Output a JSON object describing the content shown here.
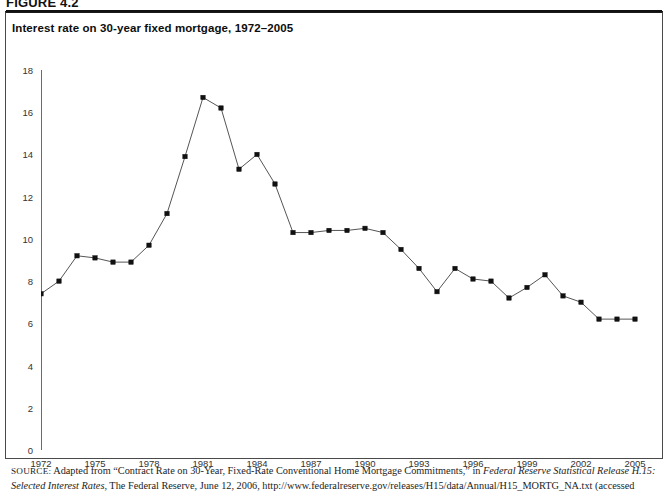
{
  "figure": {
    "label": "FIGURE 4.2",
    "title": "Interest rate on 30-year fixed mortgage, 1972–2005"
  },
  "source": {
    "prefix": "SOURCE:",
    "line1_a": " Adapted from “Contract Rate on 30-Year, Fixed-Rate Conventional Home Mortgage Commitments,” in ",
    "line1_italic": "Federal Reserve Statistical Release H.15:",
    "line2_italic": "Selected Interest Rates",
    "line2_b": ", The Federal Reserve, June 12, 2006, http://www.federalreserve.gov/releases/H15/data/Annual/H15_MORTG_NA.txt (accessed"
  },
  "chart_data": {
    "type": "line",
    "title": "Interest rate on 30-year fixed mortgage, 1972–2005",
    "xlabel": "",
    "ylabel": "",
    "xlim": [
      1972,
      2005
    ],
    "ylim": [
      0,
      18
    ],
    "ytick_step": 2,
    "xtick_step": 3,
    "grid": false,
    "legend_position": "none",
    "marker": "square",
    "marker_color": "#111111",
    "line_color": "#555555",
    "yticks": [
      0,
      2,
      4,
      6,
      8,
      10,
      12,
      14,
      16,
      18
    ],
    "xticks": [
      1972,
      1975,
      1978,
      1981,
      1984,
      1987,
      1990,
      1993,
      1996,
      1999,
      2002,
      2005
    ],
    "x": [
      1972,
      1973,
      1974,
      1975,
      1976,
      1977,
      1978,
      1979,
      1980,
      1981,
      1982,
      1983,
      1984,
      1985,
      1986,
      1987,
      1988,
      1989,
      1990,
      1991,
      1992,
      1993,
      1994,
      1995,
      1996,
      1997,
      1998,
      1999,
      2000,
      2001,
      2002,
      2003,
      2004,
      2005
    ],
    "values": [
      7.4,
      8.0,
      9.2,
      9.1,
      8.9,
      8.9,
      9.7,
      11.2,
      13.9,
      16.7,
      16.2,
      13.3,
      14.0,
      12.6,
      10.3,
      10.3,
      10.4,
      10.4,
      10.5,
      10.3,
      9.5,
      8.6,
      7.5,
      8.6,
      8.1,
      8.0,
      7.2,
      7.7,
      8.3,
      7.3,
      7.0,
      6.2,
      6.2,
      6.2
    ],
    "series": [
      {
        "name": "30-year fixed mortgage rate",
        "values": [
          7.4,
          8.0,
          9.2,
          9.1,
          8.9,
          8.9,
          9.7,
          11.2,
          13.9,
          16.7,
          16.2,
          13.3,
          14.0,
          12.6,
          10.3,
          10.3,
          10.4,
          10.4,
          10.5,
          10.3,
          9.5,
          8.6,
          7.5,
          8.6,
          8.1,
          8.0,
          7.2,
          7.7,
          8.3,
          7.3,
          7.0,
          6.2,
          6.2,
          6.2
        ]
      }
    ]
  }
}
